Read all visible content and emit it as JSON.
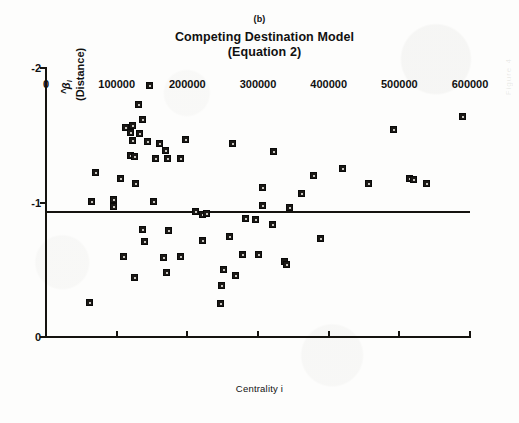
{
  "figure": {
    "panel_label": "(b)",
    "title_line1": "Competing Destination Model",
    "title_line2": "(Equation 2)",
    "ghost_marginalia": "Figure 4",
    "ink_color": "#15130f",
    "background_color": "#fdfdfc",
    "marker_color": "#1b1916"
  },
  "chart_data": {
    "type": "scatter",
    "title": "Competing Destination Model (Equation 2)",
    "panel": "(b)",
    "xlabel": "Centrality i",
    "ylabel": "β̂i (Distance)",
    "ylabel_symbol": "β",
    "ylabel_hat": "^",
    "ylabel_subscript": "i",
    "ylabel_paren": "(Distance)",
    "xlim": [
      0,
      600000
    ],
    "ylim": [
      -2,
      0
    ],
    "y_axis_inverted": true,
    "xticks": [
      0,
      100000,
      200000,
      300000,
      400000,
      500000,
      600000
    ],
    "xticklabels": [
      "0",
      "100000",
      "200000",
      "300000",
      "400000",
      "500000",
      "600000"
    ],
    "yticks": [
      -2,
      -1,
      0
    ],
    "yticklabels": [
      "-2",
      "-1",
      "0"
    ],
    "grid": false,
    "legend": null,
    "reference_line": {
      "type": "horizontal",
      "y": -0.93,
      "x_start": 0,
      "x_end": 600000,
      "label": ""
    },
    "series": [
      {
        "name": "Estimated distance decay parameter",
        "marker": "filled-square",
        "points": [
          [
            146000,
            -1.87
          ],
          [
            131000,
            -1.73
          ],
          [
            137000,
            -1.62
          ],
          [
            112000,
            -1.56
          ],
          [
            123000,
            -1.57
          ],
          [
            119000,
            -1.52
          ],
          [
            133000,
            -1.51
          ],
          [
            122000,
            -1.46
          ],
          [
            143000,
            -1.45
          ],
          [
            198000,
            -1.47
          ],
          [
            160000,
            -1.44
          ],
          [
            169000,
            -1.39
          ],
          [
            120000,
            -1.35
          ],
          [
            125000,
            -1.34
          ],
          [
            155000,
            -1.33
          ],
          [
            172000,
            -1.33
          ],
          [
            191000,
            -1.33
          ],
          [
            264000,
            -1.44
          ],
          [
            322000,
            -1.38
          ],
          [
            70000,
            -1.22
          ],
          [
            106000,
            -1.18
          ],
          [
            126000,
            -1.14
          ],
          [
            307000,
            -1.11
          ],
          [
            361000,
            -1.07
          ],
          [
            378000,
            -1.2
          ],
          [
            420000,
            -1.25
          ],
          [
            457000,
            -1.14
          ],
          [
            492000,
            -1.54
          ],
          [
            514000,
            -1.18
          ],
          [
            520000,
            -1.17
          ],
          [
            538000,
            -1.14
          ],
          [
            589000,
            -1.64
          ],
          [
            64000,
            -1.01
          ],
          [
            95000,
            -1.02
          ],
          [
            96000,
            -0.97
          ],
          [
            152000,
            -1.01
          ],
          [
            307000,
            -0.98
          ],
          [
            345000,
            -0.96
          ],
          [
            212000,
            -0.93
          ],
          [
            222000,
            -0.91
          ],
          [
            227000,
            -0.92
          ],
          [
            283000,
            -0.88
          ],
          [
            297000,
            -0.87
          ],
          [
            320000,
            -0.84
          ],
          [
            137000,
            -0.8
          ],
          [
            174000,
            -0.79
          ],
          [
            139000,
            -0.71
          ],
          [
            222000,
            -0.72
          ],
          [
            259000,
            -0.75
          ],
          [
            388000,
            -0.73
          ],
          [
            110000,
            -0.6
          ],
          [
            166000,
            -0.59
          ],
          [
            190000,
            -0.6
          ],
          [
            278000,
            -0.61
          ],
          [
            300000,
            -0.61
          ],
          [
            337000,
            -0.56
          ],
          [
            341000,
            -0.54
          ],
          [
            251000,
            -0.5
          ],
          [
            171000,
            -0.48
          ],
          [
            125000,
            -0.44
          ],
          [
            268000,
            -0.46
          ],
          [
            249000,
            -0.38
          ],
          [
            62000,
            -0.26
          ],
          [
            247000,
            -0.25
          ]
        ]
      }
    ]
  },
  "axis_label_bottom": "Centrality i"
}
